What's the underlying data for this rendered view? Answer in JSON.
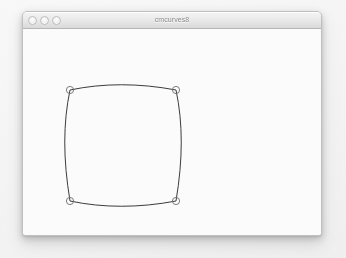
{
  "window": {
    "title": "cmcurves8",
    "controls": [
      {
        "name": "close-button",
        "label": "close",
        "color": "#e2e2e2"
      },
      {
        "name": "minimize-button",
        "label": "minimize",
        "color": "#e2e2e2"
      },
      {
        "name": "zoom-button",
        "label": "zoom",
        "color": "#e2e2e2"
      }
    ]
  },
  "canvas": {
    "background_color": "#fbfbfb",
    "stroke_color": "#3b3b3b",
    "stroke_width": 1,
    "marker_stroke_color": "#6e6e6e",
    "marker_radius": 3.6,
    "shape_name": "rounded-square-bezier-curve",
    "path": "M 47 61 C 80 54 116 54 153 61 C 160 94 160 130 153 172 C 116 179 80 179 47 172 C 40 130 40 94 47 61 Z",
    "control_points": [
      {
        "name": "control-point-top-left",
        "x": 47,
        "y": 61
      },
      {
        "name": "control-point-top-right",
        "x": 153,
        "y": 61
      },
      {
        "name": "control-point-bottom-left",
        "x": 47,
        "y": 172
      },
      {
        "name": "control-point-bottom-right",
        "x": 153,
        "y": 172
      }
    ]
  }
}
